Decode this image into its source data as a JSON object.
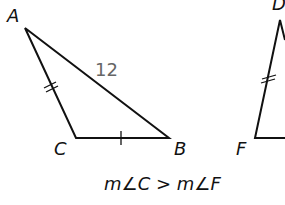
{
  "diagram": {
    "triangle_abc": {
      "vertices": {
        "A": "A",
        "B": "B",
        "C": "C"
      },
      "side_ab_length": "12",
      "marks": {
        "AC": "double-tick",
        "CB": "single-tick"
      }
    },
    "triangle_def": {
      "vertices": {
        "D": "D",
        "F": "F"
      },
      "marks": {
        "DF": "double-tick"
      }
    },
    "caption": "m∠C > m∠F"
  }
}
